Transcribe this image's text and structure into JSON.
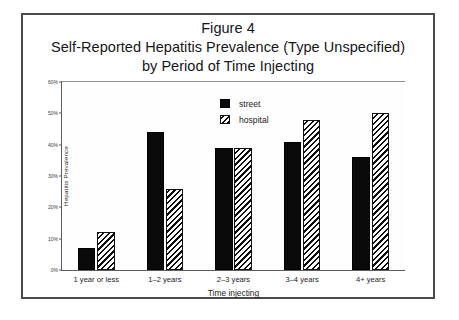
{
  "figure": {
    "caption_lines": [
      "Figure 4",
      "Self-Reported Hepatitis Prevalence (Type Unspecified)",
      "by Period of Time Injecting"
    ]
  },
  "chart_data": {
    "type": "bar",
    "title": "Self-Reported Hepatitis Prevalence (Type Unspecified) by Period of Time Injecting",
    "xlabel": "Time injecting",
    "ylabel": "Hepatitis Prevalence",
    "categories": [
      "1 year or less",
      "1–2 years",
      "2–3 years",
      "3–4 years",
      "4+ years"
    ],
    "series": [
      {
        "name": "street",
        "values": [
          7,
          44,
          39,
          41,
          36
        ]
      },
      {
        "name": "hospital",
        "values": [
          12,
          26,
          39,
          48,
          50
        ]
      }
    ],
    "ylim": [
      0,
      60
    ],
    "yticks": [
      0,
      10,
      20,
      30,
      40,
      50,
      60
    ],
    "ytick_labels": [
      "0%",
      "10%",
      "20%",
      "30%",
      "40%",
      "50%",
      "60%"
    ],
    "grid": false,
    "legend_position": "upper center",
    "legend_entries": [
      "street",
      "hospital"
    ]
  }
}
